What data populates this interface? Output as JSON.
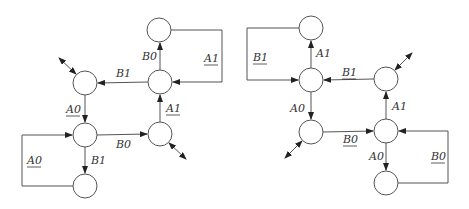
{
  "diagrams": [
    {
      "name": "left-state-diagram",
      "nodes": [
        {
          "id": "L1",
          "cx": 159,
          "cy": 30
        },
        {
          "id": "L2",
          "cx": 160,
          "cy": 82
        },
        {
          "id": "L3",
          "cx": 85,
          "cy": 83
        },
        {
          "id": "L4",
          "cx": 85,
          "cy": 135
        },
        {
          "id": "L5",
          "cx": 160,
          "cy": 134
        },
        {
          "id": "L6",
          "cx": 85,
          "cy": 186
        }
      ],
      "labels": [
        {
          "text": "B0",
          "x": 142,
          "y": 60,
          "underline": false
        },
        {
          "text": "A1",
          "x": 204,
          "y": 62,
          "underline": true
        },
        {
          "text": "B1",
          "x": 116,
          "y": 77,
          "underline": false
        },
        {
          "text": "A0",
          "x": 66,
          "y": 113,
          "underline": true
        },
        {
          "text": "A1",
          "x": 166,
          "y": 112,
          "underline": true
        },
        {
          "text": "B0",
          "x": 116,
          "y": 148,
          "underline": false
        },
        {
          "text": "A0",
          "x": 27,
          "y": 164,
          "underline": true
        },
        {
          "text": "B1",
          "x": 91,
          "y": 164,
          "underline": false
        }
      ]
    },
    {
      "name": "right-state-diagram",
      "nodes": [
        {
          "id": "R1",
          "cx": 311,
          "cy": 28
        },
        {
          "id": "R2",
          "cx": 311,
          "cy": 80
        },
        {
          "id": "R3",
          "cx": 386,
          "cy": 79
        },
        {
          "id": "R4",
          "cx": 311,
          "cy": 132
        },
        {
          "id": "R5",
          "cx": 386,
          "cy": 131
        },
        {
          "id": "R6",
          "cx": 386,
          "cy": 183
        }
      ],
      "labels": [
        {
          "text": "A1",
          "x": 316,
          "y": 57,
          "underline": false
        },
        {
          "text": "B1",
          "x": 253,
          "y": 61,
          "underline": true
        },
        {
          "text": "B1",
          "x": 342,
          "y": 76,
          "underline": true
        },
        {
          "text": "A0",
          "x": 290,
          "y": 112,
          "underline": false
        },
        {
          "text": "A1",
          "x": 392,
          "y": 110,
          "underline": false
        },
        {
          "text": "B0",
          "x": 343,
          "y": 143,
          "underline": true
        },
        {
          "text": "A0",
          "x": 369,
          "y": 160,
          "underline": false
        },
        {
          "text": "B0",
          "x": 431,
          "y": 160,
          "underline": true
        }
      ]
    }
  ]
}
